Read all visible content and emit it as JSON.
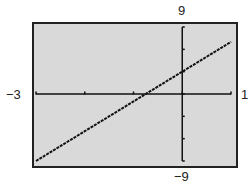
{
  "chart_data": {
    "type": "line",
    "title": "",
    "xlabel": "",
    "ylabel": "",
    "xlim": [
      -3,
      1
    ],
    "ylim": [
      -9,
      9
    ],
    "x_scale": 1,
    "y_scale": 3,
    "grid": false,
    "legend": null,
    "window_labels": {
      "xmin": "−3",
      "xmax": "1",
      "ymin": "−9",
      "ymax": "9"
    },
    "series": [
      {
        "name": "y = 4x + 3",
        "x": [
          -3,
          -2,
          -1,
          0,
          1
        ],
        "y": [
          -9,
          -5,
          -1,
          3,
          7
        ]
      }
    ],
    "style": {
      "background": "#d9d9d9",
      "frame": "#222222",
      "axis": "#111111",
      "line": "#111111"
    }
  }
}
